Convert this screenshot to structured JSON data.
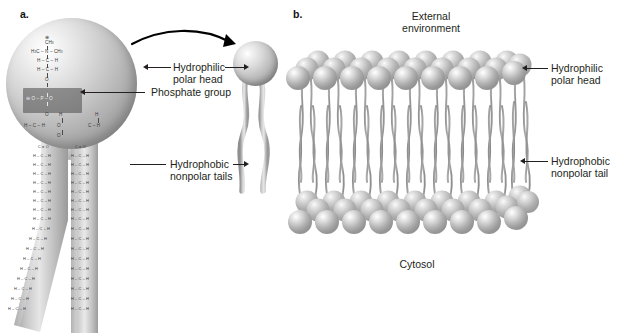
{
  "figure": {
    "background_color": "#ffffff",
    "ink_color": "#231f20",
    "sphere_color": "#b9b9b9",
    "tail_color": "#8f8f8f",
    "highlight_box_color": "#4a4a4a"
  },
  "panel_a": {
    "letter": "a.",
    "labels": {
      "hydrophilic_head": "Hydrophilic\npolar head",
      "hydrophilic_head_line1": "Hydrophilic",
      "hydrophilic_head_line2": "polar head",
      "phosphate_group": "Phosphate group",
      "hydrophobic_tails_line1": "Hydrophobic",
      "hydrophobic_tails_line2": "nonpolar tails"
    },
    "molecule_structure": {
      "headgroup_name": "choline",
      "charge_symbols": [
        "⊕",
        "⊖"
      ],
      "rows": [
        "⊕",
        "CH3",
        "H3C – N – CH3",
        "H – C – H",
        "H – C – H",
        "O",
        "⊖ O – P – O",
        "O",
        "H – C – H",
        "C = O",
        "H – C – H"
      ],
      "tail_repeat_unit": "H – C – H",
      "ester_unit": "C = O",
      "left_tail_units": 14,
      "right_tail_units": 16,
      "left_tail_kinked": true,
      "right_tail_kinked": false
    },
    "simplified_molecule": {
      "head_shape": "sphere",
      "tail_count": 2
    }
  },
  "panel_b": {
    "letter": "b.",
    "labels": {
      "external_environment_line1": "External",
      "external_environment_line2": "environment",
      "cytosol": "Cytosol",
      "hydrophilic_head_line1": "Hydrophilic",
      "hydrophilic_head_line2": "polar head",
      "hydrophobic_tail_line1": "Hydrophobic",
      "hydrophobic_tail_line2": "nonpolar tail"
    },
    "bilayer": {
      "leaflets": 2,
      "heads_per_row_front": 8,
      "depth_rows": 3,
      "tails_per_head": 2
    }
  }
}
